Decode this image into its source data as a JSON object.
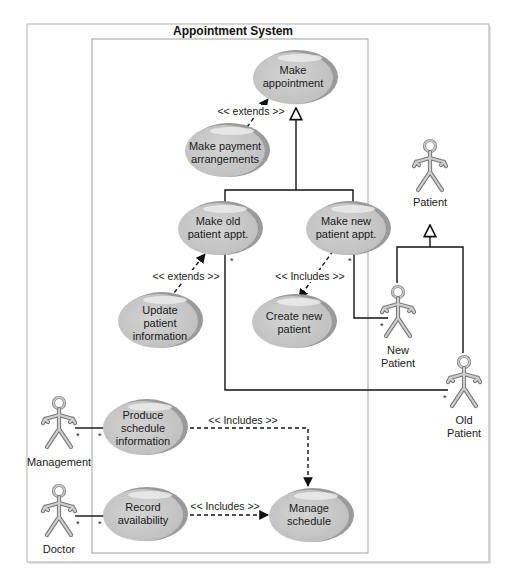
{
  "diagram": {
    "type": "UML use case diagram",
    "system_title": "Appointment System",
    "use_cases": {
      "make_appointment": [
        "Make",
        "appointment"
      ],
      "make_payment": [
        "Make payment",
        "arrangements"
      ],
      "make_old_appt": [
        "Make old",
        "patient appt."
      ],
      "make_new_appt": [
        "Make new",
        "patient appt."
      ],
      "update_patient": [
        "Update",
        "patient",
        "information"
      ],
      "create_new_patient": [
        "Create new",
        "patient"
      ],
      "produce_schedule": [
        "Produce",
        "schedule",
        "information"
      ],
      "record_availability": [
        "Record",
        "availability"
      ],
      "manage_schedule": [
        "Manage",
        "schedule"
      ]
    },
    "actors": {
      "patient": [
        "Patient"
      ],
      "new_patient": [
        "New",
        "Patient"
      ],
      "old_patient": [
        "Old",
        "Patient"
      ],
      "management": [
        "Management"
      ],
      "doctor": [
        "Doctor"
      ]
    },
    "stereotypes": {
      "extends_payment": "<< extends >>",
      "extends_update": "<< extends >>",
      "includes_create": "<< Includes >>",
      "includes_produce": "<< Includes >>",
      "includes_record": "<< Includes >>"
    },
    "multiplicity": "*",
    "colors": {
      "ellipse_fill": "#c8c8c8",
      "ellipse_shadow": "#9a9a9a",
      "actor_fill": "#bdbdbd",
      "actor_stroke": "#777777",
      "frame_border": "#b0b0b0",
      "line": "#111111"
    }
  }
}
